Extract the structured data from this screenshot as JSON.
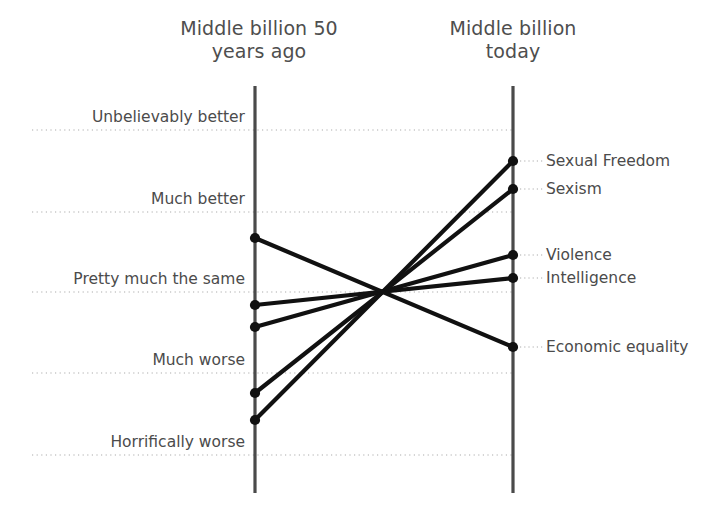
{
  "header": {
    "left_title": "Middle billion 50\nyears ago",
    "right_title": "Middle billion\ntoday"
  },
  "style": {
    "axis_color": "#4a4a4a",
    "gridline_color": "#c8c8c8",
    "series_color": "#111111",
    "text_color": "#4b4b4b",
    "background": "#ffffff"
  },
  "chart_data": {
    "type": "line",
    "subtype": "slope-chart",
    "title": "",
    "subtitle": "",
    "xlabel": "",
    "ylabel": "",
    "grid": true,
    "legend_position": "right-labels",
    "x": [
      "Middle billion 50 years ago",
      "Middle billion today"
    ],
    "x_axis_labels": [
      "Middle billion 50\nyears ago",
      "Middle billion today"
    ],
    "y_categories": [
      "Unbelievably better",
      "Much better",
      "Pretty much the same",
      "Much worse",
      "Horrifically worse"
    ],
    "y_category_values": [
      5,
      4,
      3,
      2,
      1
    ],
    "gridline_pixels_y": [
      130,
      212,
      292,
      373,
      455
    ],
    "axis_pixels_x": [
      255,
      513
    ],
    "axis_pixels_y_range": [
      86,
      493
    ],
    "crossing_point_pixels": [
      385,
      292
    ],
    "series": [
      {
        "name": "Sexual Freedom",
        "left_pixel_y": 420,
        "right_pixel_y": 161,
        "left_value": 1.43,
        "right_value": 4.63,
        "left_category": "between Horrifically worse and Much worse",
        "right_category": "between Much better and Unbelievably better",
        "direction": "up"
      },
      {
        "name": "Sexism",
        "left_pixel_y": 393,
        "right_pixel_y": 189,
        "left_value": 1.77,
        "right_value": 4.28,
        "left_category": "just above Much worse",
        "right_category": "just above Much better",
        "direction": "up"
      },
      {
        "name": "Violence",
        "left_pixel_y": 327,
        "right_pixel_y": 255,
        "left_value": 2.57,
        "right_value": 3.46,
        "left_category": "between Much worse and Pretty much the same",
        "right_category": "between Pretty much the same and Much better",
        "direction": "up"
      },
      {
        "name": "Intelligence",
        "left_pixel_y": 305,
        "right_pixel_y": 278,
        "left_value": 2.84,
        "right_value": 3.17,
        "left_category": "just below Pretty much the same",
        "right_category": "just above Pretty much the same",
        "direction": "up"
      },
      {
        "name": "Economic equality",
        "left_pixel_y": 238,
        "right_pixel_y": 347,
        "left_value": 3.67,
        "right_value": 2.32,
        "left_category": "between Pretty much the same and Much better",
        "right_category": "between Much worse and Pretty much the same",
        "direction": "down"
      }
    ]
  }
}
